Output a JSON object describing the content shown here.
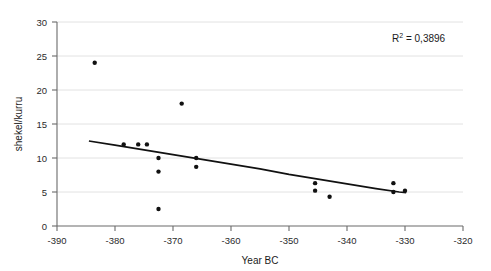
{
  "chart_data": {
    "type": "scatter",
    "title": "",
    "xlabel": "Year BC",
    "ylabel": "shekel/kurru",
    "xlim": [
      -390,
      -320
    ],
    "ylim": [
      0,
      30
    ],
    "xticks": [
      -390,
      -380,
      -370,
      -360,
      -350,
      -340,
      -330,
      -320
    ],
    "xticklabels": [
      "-390",
      "-380",
      "-370",
      "-360",
      "-350",
      "-340",
      "-330",
      "-320"
    ],
    "yticks": [
      0,
      5,
      10,
      15,
      20,
      25,
      30
    ],
    "yticklabels": [
      "0",
      "5",
      "10",
      "15",
      "20",
      "25",
      "30"
    ],
    "grid": "horizontal",
    "legend": "none",
    "marker": "filled-circle",
    "marker_color": "#111111",
    "trend_color": "#111111",
    "grid_color": "#e2e2e2",
    "axis_color": "#6b6b6b",
    "points": [
      {
        "x": -383.5,
        "y": 24.0
      },
      {
        "x": -378.5,
        "y": 12.0
      },
      {
        "x": -376.0,
        "y": 12.0
      },
      {
        "x": -374.5,
        "y": 12.0
      },
      {
        "x": -372.5,
        "y": 10.0
      },
      {
        "x": -372.5,
        "y": 8.0
      },
      {
        "x": -372.5,
        "y": 2.5
      },
      {
        "x": -368.5,
        "y": 18.0
      },
      {
        "x": -366.0,
        "y": 10.0
      },
      {
        "x": -366.0,
        "y": 8.7
      },
      {
        "x": -345.5,
        "y": 6.3
      },
      {
        "x": -345.5,
        "y": 5.2
      },
      {
        "x": -343.0,
        "y": 4.3
      },
      {
        "x": -332.0,
        "y": 6.3
      },
      {
        "x": -332.0,
        "y": 5.0
      },
      {
        "x": -330.0,
        "y": 5.2
      }
    ],
    "trendline": {
      "kind": "power-decay",
      "points": [
        {
          "x": -384.5,
          "y": 12.5
        },
        {
          "x": -380.0,
          "y": 11.9
        },
        {
          "x": -375.0,
          "y": 11.2
        },
        {
          "x": -370.0,
          "y": 10.5
        },
        {
          "x": -365.0,
          "y": 9.8
        },
        {
          "x": -360.0,
          "y": 9.1
        },
        {
          "x": -355.0,
          "y": 8.4
        },
        {
          "x": -350.0,
          "y": 7.6
        },
        {
          "x": -345.0,
          "y": 6.9
        },
        {
          "x": -340.0,
          "y": 6.2
        },
        {
          "x": -335.0,
          "y": 5.5
        },
        {
          "x": -331.0,
          "y": 5.0
        },
        {
          "x": -329.8,
          "y": 4.9
        }
      ]
    },
    "annotations": [
      {
        "name": "r-squared",
        "text_prefix": "R",
        "text_sup": "2",
        "text_suffix": " = 0,3896",
        "full_text": "R² = 0,3896",
        "x_px": 392,
        "y_px": 42
      }
    ]
  }
}
